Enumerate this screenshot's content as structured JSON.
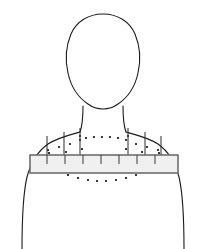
{
  "figure": {
    "colors": {
      "background": "#ffffff",
      "outline": "#1a1a1a",
      "bar_fill": "#f0f0f0",
      "bar_stroke": "#6e6e6e",
      "tick": "#4a4a4a",
      "needle": "#2a2a2a",
      "dot": "#3b3b3b"
    }
  },
  "head": {
    "label": "head-outline",
    "path": "M 103 14 C 88 14 76 22 71 34 C 66 46 65 60 68 73 C 71 87 79 98 88 104 C 92 107 97 109 103 109 C 109 109 114 107 118 104 C 127 98 135 87 138 73 C 141 60 140 46 135 34 C 130 22 118 14 103 14 Z"
  },
  "neck": {
    "label": "neck-outline",
    "left_path": "M 83 106 C 83 114 83 124 80 132",
    "right_path": "M 123 106 C 123 114 123 124 126 132"
  },
  "torso": {
    "label": "torso-outline",
    "left_path": "M 80 132 C 69 135 57 138 48 144 C 38 151 31 162 27 177 C 23 194 22 216 22 249",
    "right_path": "M 126 132 C 137 135 149 138 158 144 C 168 151 175 162 179 177 C 183 194 184 216 184 249"
  },
  "collar_bar": {
    "label": "horizontal-measurement-bar",
    "x": 30,
    "y": 155,
    "width": 148,
    "height": 18,
    "tick_positions": [
      47,
      65,
      83,
      101,
      119,
      137,
      155
    ],
    "tick_top_inset": 0,
    "tick_height": 9
  },
  "needles": {
    "label": "vertical-needle-lines",
    "lines": [
      {
        "x": 47,
        "y1": 136,
        "y2": 166
      },
      {
        "x": 64,
        "y1": 132,
        "y2": 166
      },
      {
        "x": 80,
        "y1": 128,
        "y2": 166
      },
      {
        "x": 128,
        "y1": 128,
        "y2": 166
      },
      {
        "x": 145,
        "y1": 132,
        "y2": 166
      },
      {
        "x": 161,
        "y1": 136,
        "y2": 166
      }
    ]
  },
  "dot_arc_upper": {
    "label": "upper-dotted-arc",
    "dots": [
      {
        "x": 48,
        "y": 150
      },
      {
        "x": 59,
        "y": 147
      },
      {
        "x": 70,
        "y": 144
      },
      {
        "x": 80,
        "y": 140
      },
      {
        "x": 86,
        "y": 138
      },
      {
        "x": 94,
        "y": 137
      },
      {
        "x": 102,
        "y": 137
      },
      {
        "x": 110,
        "y": 137
      },
      {
        "x": 118,
        "y": 138
      },
      {
        "x": 126,
        "y": 140
      },
      {
        "x": 136,
        "y": 144
      },
      {
        "x": 147,
        "y": 147
      },
      {
        "x": 158,
        "y": 150
      }
    ]
  },
  "dot_arc_lower": {
    "label": "lower-dotted-arc",
    "dots": [
      {
        "x": 68,
        "y": 175
      },
      {
        "x": 78,
        "y": 178
      },
      {
        "x": 88,
        "y": 180
      },
      {
        "x": 97,
        "y": 181
      },
      {
        "x": 106,
        "y": 181
      },
      {
        "x": 116,
        "y": 180
      },
      {
        "x": 126,
        "y": 178
      },
      {
        "x": 136,
        "y": 175
      }
    ]
  },
  "dot_scatter": {
    "label": "scatter-marker-dots",
    "dots": [
      {
        "x": 49,
        "y": 153
      },
      {
        "x": 66,
        "y": 152
      },
      {
        "x": 82,
        "y": 149
      },
      {
        "x": 80,
        "y": 136
      },
      {
        "x": 128,
        "y": 136
      },
      {
        "x": 126,
        "y": 149
      },
      {
        "x": 142,
        "y": 152
      },
      {
        "x": 159,
        "y": 153
      }
    ]
  }
}
